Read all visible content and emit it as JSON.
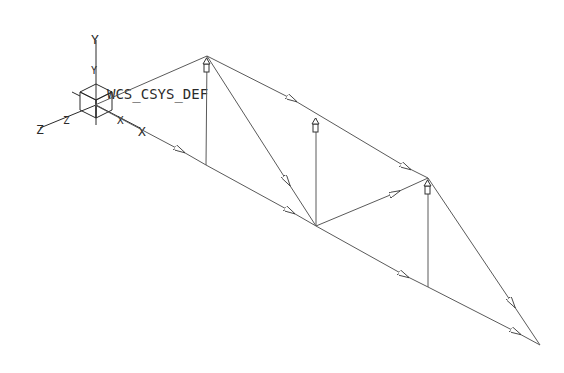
{
  "diagram": {
    "type": "truss",
    "csys_label": "WCS_CSYS_DEF",
    "axis_labels": {
      "y": "Y",
      "y_small": "Y",
      "z": "Z",
      "z_small": "Z",
      "x": "X",
      "x_small": "X"
    },
    "nodes": {
      "origin": [
        95,
        105
      ],
      "top1": [
        207,
        56
      ],
      "bot1": [
        206,
        165
      ],
      "mid": [
        316,
        226
      ],
      "top2": [
        428,
        178
      ],
      "bot2": [
        428,
        287
      ],
      "tip": [
        540,
        345
      ]
    },
    "members": [
      {
        "from": "origin",
        "to": "top1"
      },
      {
        "from": "origin",
        "to": "bot1"
      },
      {
        "from": "top1",
        "to": "bot1"
      },
      {
        "from": "top1",
        "to": "mid"
      },
      {
        "from": "top1",
        "to": "top2"
      },
      {
        "from": "bot1",
        "to": "mid"
      },
      {
        "from": "mid",
        "to": "top2"
      },
      {
        "from": "mid",
        "to": "bot2"
      },
      {
        "from": "top2",
        "to": "bot2"
      },
      {
        "from": "top2",
        "to": "tip"
      },
      {
        "from": "bot2",
        "to": "tip"
      },
      {
        "from": "mid",
        "to": "mid_up"
      }
    ],
    "colors": {
      "line": "#5a5a5a",
      "text": "#2a2a2a",
      "background": "#ffffff"
    }
  }
}
